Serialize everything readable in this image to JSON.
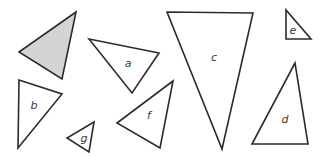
{
  "diagram": {
    "width": 326,
    "height": 158,
    "stroke_color": "#2b2b2b",
    "shaded_fill": "#d4d4d4",
    "unshaded_fill": "#ffffff",
    "triangles": [
      {
        "id": "shaded",
        "label": "",
        "shaded": true,
        "points": "76,12 19,52 62,79",
        "label_pos": [
          0,
          0
        ]
      },
      {
        "id": "a",
        "label": "a",
        "shaded": false,
        "points": "89,39 159,53 132,93",
        "label_pos": [
          128,
          64
        ]
      },
      {
        "id": "b",
        "label": "b",
        "shaded": false,
        "points": "19,80 62,94 18,148",
        "label_pos": [
          34,
          106
        ]
      },
      {
        "id": "c",
        "label": "c",
        "shaded": false,
        "points": "167,12 253,13 222,149",
        "label_pos": [
          214,
          58
        ]
      },
      {
        "id": "d",
        "label": "d",
        "shaded": false,
        "points": "295,63 252,144 308,144",
        "label_pos": [
          285,
          120
        ]
      },
      {
        "id": "e",
        "label": "e",
        "shaded": false,
        "points": "286,10 286,39 311,39",
        "label_pos": [
          293,
          31
        ]
      },
      {
        "id": "f",
        "label": "f",
        "shaded": false,
        "points": "173,81 117,123 160,148",
        "label_pos": [
          149,
          116
        ]
      },
      {
        "id": "g",
        "label": "g",
        "shaded": false,
        "points": "94,122 67,138 89,152",
        "label_pos": [
          84,
          139
        ]
      }
    ]
  }
}
